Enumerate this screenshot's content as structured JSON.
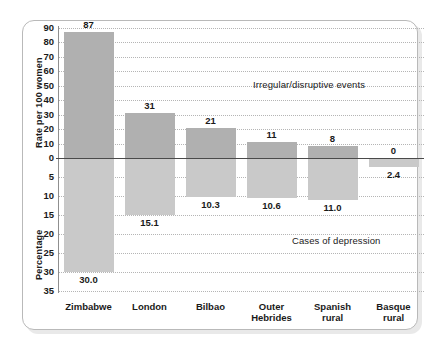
{
  "chart_data": {
    "type": "bar",
    "title": "",
    "subtitle": "",
    "categories": [
      "Zimbabwe",
      "London",
      "Bilbao",
      "Outer Hebrides",
      "Spanish rural",
      "Basque rural"
    ],
    "category_lines": [
      [
        "Zimbabwe"
      ],
      [
        "London"
      ],
      [
        "Bilbao"
      ],
      [
        "Outer",
        "Hebrides"
      ],
      [
        "Spanish",
        "rural"
      ],
      [
        "Basque",
        "rural"
      ]
    ],
    "series": [
      {
        "name": "Irregular/disruptive events",
        "axis": "upper",
        "ylabel": "Rate per 100 women",
        "values": [
          87,
          31,
          21,
          11,
          8,
          0
        ],
        "value_labels": [
          "87",
          "31",
          "21",
          "11",
          "8",
          "0"
        ],
        "color": "#b0b0b0",
        "ylim": [
          0,
          90
        ],
        "yticks": [
          90,
          80,
          70,
          60,
          50,
          40,
          30,
          20,
          10,
          0
        ]
      },
      {
        "name": "Cases of depression",
        "axis": "lower",
        "ylabel": "Percentage",
        "values": [
          30.0,
          15.1,
          10.3,
          10.6,
          11.0,
          2.4
        ],
        "value_labels": [
          "30.0",
          "15.1",
          "10.3",
          "10.6",
          "11.0",
          "2.4"
        ],
        "color": "#c9c9c9",
        "ylim": [
          0,
          35
        ],
        "yticks": [
          0,
          5,
          10,
          15,
          20,
          25,
          30,
          35
        ]
      }
    ],
    "annotations": [
      {
        "text": "Irregular/disruptive events",
        "region": "upper-right"
      },
      {
        "text": "Cases of depression",
        "region": "lower-right"
      }
    ],
    "xlabel": "",
    "grid": "dotted-horizontal",
    "legend_position": "inline-annotation",
    "zero_line": true,
    "axis_titles": {
      "upper": "Rate per 100 women",
      "lower": "Percentage"
    },
    "upper_tick_labels": [
      "90",
      "80",
      "70",
      "60",
      "50",
      "40",
      "30",
      "20",
      "10",
      "0"
    ],
    "lower_tick_labels": [
      "5",
      "10",
      "15",
      "20",
      "25",
      "30",
      "35"
    ],
    "colors": {
      "upper_bar": "#b0b0b0",
      "lower_bar": "#c9c9c9",
      "grid": "#b5b5b5",
      "zero_line": "#4a4a4a",
      "frame": "#b9b9b9",
      "text": "#1a1a1a",
      "background": "#ffffff"
    }
  }
}
